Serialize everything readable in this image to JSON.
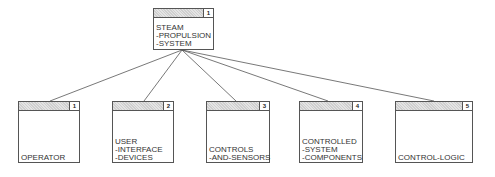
{
  "root": {
    "number": "1",
    "label": "STEAM\n-PROPULSION\n-SYSTEM"
  },
  "children": [
    {
      "number": "1",
      "label": "OPERATOR"
    },
    {
      "number": "2",
      "label": "USER\n-INTERFACE\n-DEVICES"
    },
    {
      "number": "3",
      "label": "CONTROLS\n-AND-SENSORS"
    },
    {
      "number": "4",
      "label": "CONTROLLED\n-SYSTEM\n-COMPONENTS"
    },
    {
      "number": "5",
      "label": "CONTROL-LOGIC"
    }
  ]
}
